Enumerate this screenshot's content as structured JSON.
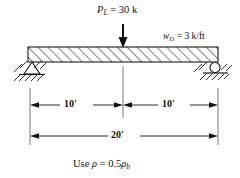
{
  "figure": {
    "beam": {
      "name": "beam",
      "hatch_pattern": "diagonal",
      "left_support_type": "pin",
      "right_support_type": "roller"
    },
    "loads": {
      "point_load": {
        "symbol": "P",
        "subscript": "L",
        "equals": "=",
        "value": "30",
        "unit": "k",
        "full_text": "P_L = 30 k"
      },
      "distributed_load": {
        "symbol": "w",
        "subscript": "D",
        "equals": "=",
        "value": "3",
        "unit": "k/ft",
        "full_text": "w_D = 3 k/ft"
      }
    },
    "dimensions": {
      "left_span": "10'",
      "right_span": "10'",
      "total_span": "20'"
    },
    "note": {
      "prefix": "Use ",
      "rho": "ρ",
      "equals": " = ",
      "coefficient": "0.5",
      "rho_b": "ρ",
      "rho_b_sub": "b",
      "full_text": "Use ρ = 0.5ρb"
    },
    "colors": {
      "ink": "#111111",
      "line": "#1a1a1a",
      "extension_line": "#8a8a8a",
      "background": "#ffffff"
    }
  }
}
